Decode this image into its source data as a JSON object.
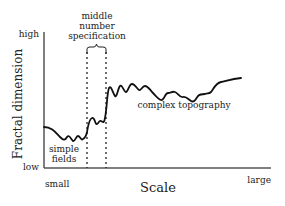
{
  "diagram": {
    "type": "conceptual line plot",
    "y_axis": {
      "label": "Fractal dimension",
      "high_label": "high",
      "low_label": "low"
    },
    "x_axis": {
      "label": "Scale",
      "small_label": "small",
      "large_label": "large"
    },
    "annotations": {
      "middle_region": "middle number specification",
      "middle_region_lines": [
        "middle",
        "number",
        "specification"
      ],
      "simple_region_lines": [
        "simple",
        "fields"
      ],
      "complex_region": "complex topography"
    },
    "colors": {
      "line": "#111111",
      "axis": "#555555",
      "text": "#222222",
      "background": "#ffffff"
    }
  }
}
